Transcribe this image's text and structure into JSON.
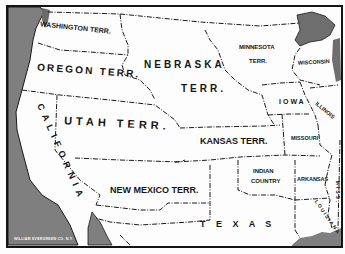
{
  "map": {
    "colors": {
      "land": "#fdfdfd",
      "water": "#7f7f7f",
      "border": "#1a1a1a",
      "frame": "#141414"
    },
    "labels": {
      "washington": "WASHINGTON TERR.",
      "oregon": "OREGON TERR.",
      "california": "CALIFORNIA",
      "utah": "UTAH TERR.",
      "nebraska_1": "NEBRASKA",
      "nebraska_2": "TERR.",
      "minnesota_1": "MINNESOTA",
      "minnesota_2": "TERR.",
      "wisconsin": "WISCONSIN",
      "iowa": "IOWA",
      "illinois": "ILLINOIS",
      "kansas": "KANSAS TERR.",
      "missouri": "MISSOURI",
      "indian_1": "INDIAN",
      "indian_2": "COUNTRY",
      "arkansas": "ARKANSAS",
      "new_mexico": "NEW MEXICO TERR.",
      "texas": "T E X A S",
      "louisiana": "LOUISIANA",
      "mississippi": "MISS."
    },
    "credit": "WILLIAM EVERGREEN CO. N.Y."
  }
}
